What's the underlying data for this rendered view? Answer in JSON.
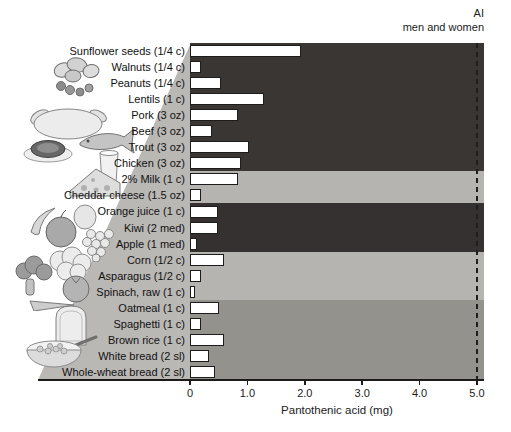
{
  "chart_data": {
    "type": "bar",
    "orientation": "horizontal",
    "xlabel": "Pantothenic acid (mg)",
    "xlim": [
      0,
      5.0
    ],
    "x_ticks": [
      {
        "label": "0",
        "mg": 0
      },
      {
        "label": "1.0",
        "mg": 1.0
      },
      {
        "label": "2.0",
        "mg": 2.0
      },
      {
        "label": "3.0",
        "mg": 3.0
      },
      {
        "label": "4.0",
        "mg": 4.0
      },
      {
        "label": "5.0",
        "mg": 5.0
      }
    ],
    "reference_line": {
      "label_line1": "AI",
      "label_line2": "men and women",
      "mg": 5.0,
      "style": "dashed",
      "color": "#1e1e1e"
    },
    "items": [
      {
        "label": "Sunflower seeds (1/4 c)",
        "mg": 1.9
      },
      {
        "label": "Walnuts (1/4 c)",
        "mg": 0.15
      },
      {
        "label": "Peanuts (1/4 c)",
        "mg": 0.5
      },
      {
        "label": "Lentils (1 c)",
        "mg": 1.25
      },
      {
        "label": "Pork (3 oz)",
        "mg": 0.8
      },
      {
        "label": "Beef (3 oz)",
        "mg": 0.35
      },
      {
        "label": "Trout (3 oz)",
        "mg": 1.0
      },
      {
        "label": "Chicken (3 oz)",
        "mg": 0.85
      },
      {
        "label": "2% Milk (1 c)",
        "mg": 0.8
      },
      {
        "label": "Cheddar cheese (1.5 oz)",
        "mg": 0.15
      },
      {
        "label": "Orange juice (1 c)",
        "mg": 0.45
      },
      {
        "label": "Kiwi (2 med)",
        "mg": 0.45
      },
      {
        "label": "Apple (1 med)",
        "mg": 0.08
      },
      {
        "label": "Corn (1/2 c)",
        "mg": 0.55
      },
      {
        "label": "Asparagus (1/2 c)",
        "mg": 0.15
      },
      {
        "label": "Spinach, raw (1 c)",
        "mg": 0.05
      },
      {
        "label": "Oatmeal (1 c)",
        "mg": 0.47
      },
      {
        "label": "Spaghetti (1 c)",
        "mg": 0.15
      },
      {
        "label": "Brown rice (1 c)",
        "mg": 0.55
      },
      {
        "label": "White bread (2 sl)",
        "mg": 0.3
      },
      {
        "label": "Whole-wheat bread (2 sl)",
        "mg": 0.4
      }
    ],
    "bands": [
      {
        "group": "protein-nuts-legumes",
        "count": 8,
        "color": "#3a3634"
      },
      {
        "group": "dairy",
        "count": 2,
        "color": "#b6b4b0"
      },
      {
        "group": "fruits",
        "count": 3,
        "color": "#343130"
      },
      {
        "group": "vegetables",
        "count": 3,
        "color": "#b6b4b0"
      },
      {
        "group": "grains",
        "count": 5,
        "color": "#94928d"
      }
    ],
    "bar_fill": "#ffffff",
    "bar_border": "#1c1c1c",
    "axis_color": "#1b1b1b",
    "wedge_color": "#bab8b5",
    "icons": [
      "nuts-icon",
      "meat-poultry-fish-icon",
      "dairy-icon",
      "fruits-icon",
      "vegetables-icon",
      "grains-icon"
    ],
    "legend_position": "none",
    "grid": false
  }
}
